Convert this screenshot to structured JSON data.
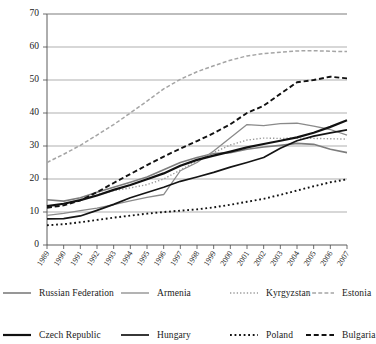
{
  "chart_data": {
    "type": "line",
    "title": "",
    "subtitle": "",
    "xlabel": "",
    "ylabel": "",
    "xlim": [
      1989,
      2007
    ],
    "ylim": [
      0,
      70
    ],
    "ytick_step": 10,
    "grid": true,
    "legend_position": "bottom",
    "x": [
      1989,
      1990,
      1991,
      1992,
      1993,
      1994,
      1995,
      1996,
      1997,
      1998,
      1999,
      2000,
      2001,
      2002,
      2003,
      2004,
      2005,
      2006,
      2007
    ],
    "ytick_labels": [
      "0",
      "10",
      "20",
      "30",
      "40",
      "50",
      "60",
      "70"
    ],
    "xtick_labels": [
      "1989",
      "1990",
      "1991",
      "1992",
      "1993",
      "1994",
      "1995",
      "1996",
      "1997",
      "1998",
      "1999",
      "2000",
      "2001",
      "2002",
      "2003",
      "2004",
      "2005",
      "2006",
      "2007"
    ],
    "series": [
      {
        "name": "Russian Federation",
        "style": "solid",
        "color": "#7d7d7d",
        "width": 1.6,
        "values": [
          13.7,
          13.3,
          14.3,
          16.0,
          17.5,
          19.0,
          20.6,
          22.8,
          25.0,
          26.5,
          27.7,
          28.0,
          29.0,
          29.7,
          30.2,
          30.8,
          30.5,
          29.0,
          28.0
        ]
      },
      {
        "name": "Armenia",
        "style": "solid",
        "color": "#8a8a8a",
        "width": 1.3,
        "values": [
          9.0,
          9.6,
          10.4,
          11.2,
          12.2,
          13.4,
          14.4,
          15.3,
          22.5,
          25.0,
          28.5,
          32.5,
          36.5,
          36.2,
          36.8,
          36.9,
          36.0,
          35.0,
          33.3
        ]
      },
      {
        "name": "Kyrgyzstan",
        "style": "dotted",
        "color": "#9a9a9a",
        "width": 1.4,
        "values": [
          11.5,
          12.5,
          13.7,
          15.2,
          16.5,
          17.3,
          18.3,
          20.0,
          22.7,
          25.5,
          28.0,
          30.3,
          31.8,
          32.4,
          32.3,
          32.4,
          32.3,
          32.2,
          32.1
        ]
      },
      {
        "name": "Estonia",
        "style": "dashed-long",
        "color": "#a5a5a5",
        "width": 1.5,
        "values": [
          25.0,
          27.5,
          30.2,
          33.3,
          36.5,
          40.0,
          43.6,
          47.3,
          50.2,
          52.5,
          54.3,
          56.0,
          57.3,
          58.0,
          58.4,
          58.8,
          58.9,
          58.7,
          58.6
        ]
      },
      {
        "name": "Czech Republic",
        "style": "solid",
        "color": "#111111",
        "width": 2.2,
        "values": [
          11.8,
          12.5,
          13.6,
          15.0,
          16.7,
          18.2,
          19.9,
          21.7,
          24.0,
          25.8,
          27.1,
          28.3,
          29.6,
          30.6,
          31.6,
          32.6,
          34.0,
          35.8,
          37.8
        ]
      },
      {
        "name": "Hungary",
        "style": "solid",
        "color": "#141414",
        "width": 1.7,
        "values": [
          7.9,
          8.0,
          8.8,
          10.5,
          12.3,
          14.3,
          15.9,
          17.5,
          19.3,
          20.6,
          22.0,
          23.6,
          25.0,
          26.5,
          29.3,
          31.6,
          33.0,
          34.0,
          34.9
        ]
      },
      {
        "name": "Poland",
        "style": "dotted",
        "color": "#111111",
        "width": 1.9,
        "values": [
          6.0,
          6.3,
          6.9,
          7.6,
          8.3,
          8.9,
          9.5,
          10.0,
          10.4,
          10.8,
          11.4,
          12.2,
          13.1,
          14.0,
          15.2,
          16.5,
          17.8,
          19.0,
          19.9
        ]
      },
      {
        "name": "Bulgaria",
        "style": "dashed-long",
        "color": "#121212",
        "width": 1.9,
        "values": [
          11.3,
          12.0,
          13.5,
          16.0,
          18.8,
          21.5,
          24.2,
          26.8,
          29.2,
          31.5,
          33.9,
          36.6,
          40.0,
          42.2,
          45.8,
          49.3,
          50.0,
          51.0,
          50.5
        ]
      }
    ]
  },
  "legend": {
    "rows": [
      [
        {
          "label": "Russian Federation",
          "key": "Russian Federation"
        },
        {
          "label": "Armenia",
          "key": "Armenia"
        },
        {
          "label": "Kyrgyzstan",
          "key": "Kyrgyzstan"
        },
        {
          "label": "Estonia",
          "key": "Estonia"
        }
      ],
      [
        {
          "label": "Czech Republic",
          "key": "Czech Republic"
        },
        {
          "label": "Hungary",
          "key": "Hungary"
        },
        {
          "label": "Poland",
          "key": "Poland"
        },
        {
          "label": "Bulgaria",
          "key": "Bulgaria"
        }
      ]
    ]
  }
}
